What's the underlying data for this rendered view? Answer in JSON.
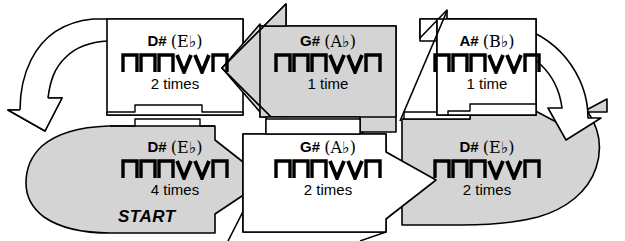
{
  "diagram": {
    "kind": "chord-progression-flowchart",
    "start_label": "START",
    "colors": {
      "shaded_fill": "#d4d4d4",
      "plain_fill": "#ffffff",
      "outline": "#000000",
      "text": "#000000"
    },
    "strum_pattern": {
      "label": "down down down up up down",
      "symbols": [
        "down",
        "down",
        "down",
        "up",
        "up",
        "down"
      ],
      "down_glyph": "⊓",
      "up_glyph": "V"
    },
    "cells": [
      {
        "id": "top-left",
        "chord_root": "D#",
        "chord_alt": "(E♭)",
        "chord_text": "D# (E♭)",
        "count": "2 times",
        "shaded": false,
        "shape": "curved-arrow-left-wrap",
        "flow_direction": "left-then-down"
      },
      {
        "id": "top-middle",
        "chord_root": "G#",
        "chord_alt": "(A♭)",
        "chord_text": "G# (A♭)",
        "count": "1 time",
        "shaded": true,
        "shape": "arrow-left",
        "flow_direction": "left"
      },
      {
        "id": "top-right",
        "chord_root": "A#",
        "chord_alt": "(B♭)",
        "chord_text": "A# (B♭)",
        "count": "1 time",
        "shaded": false,
        "shape": "curved-arrow-right-wrap",
        "flow_direction": "right-then-down"
      },
      {
        "id": "bottom-left",
        "chord_root": "D#",
        "chord_alt": "(E♭)",
        "chord_text": "D# (E♭)",
        "count": "4 times",
        "shaded": true,
        "shape": "arrow-right-rounded-tail",
        "flow_direction": "right",
        "is_start": true
      },
      {
        "id": "bottom-middle",
        "chord_root": "G#",
        "chord_alt": "(A♭)",
        "chord_text": "G# (A♭)",
        "count": "2 times",
        "shaded": false,
        "shape": "arrow-right",
        "flow_direction": "right"
      },
      {
        "id": "bottom-right",
        "chord_root": "D#",
        "chord_alt": "(E♭)",
        "chord_text": "D# (E♭)",
        "count": "2 times",
        "shaded": true,
        "shape": "curved-arrow-right-wrap-up",
        "flow_direction": "right-then-up"
      }
    ]
  }
}
